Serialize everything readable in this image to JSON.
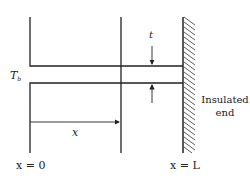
{
  "diagram": {
    "type": "fin-cross-section",
    "labels": {
      "base_temperature": "T",
      "base_temperature_subscript": "b",
      "thickness": "t",
      "position": "x",
      "origin": "x = 0",
      "end": "x = L",
      "insulated_line1": "Insulated",
      "insulated_line2": "end"
    },
    "colors": {
      "stroke": "#222222",
      "background": "#ffffff"
    }
  }
}
